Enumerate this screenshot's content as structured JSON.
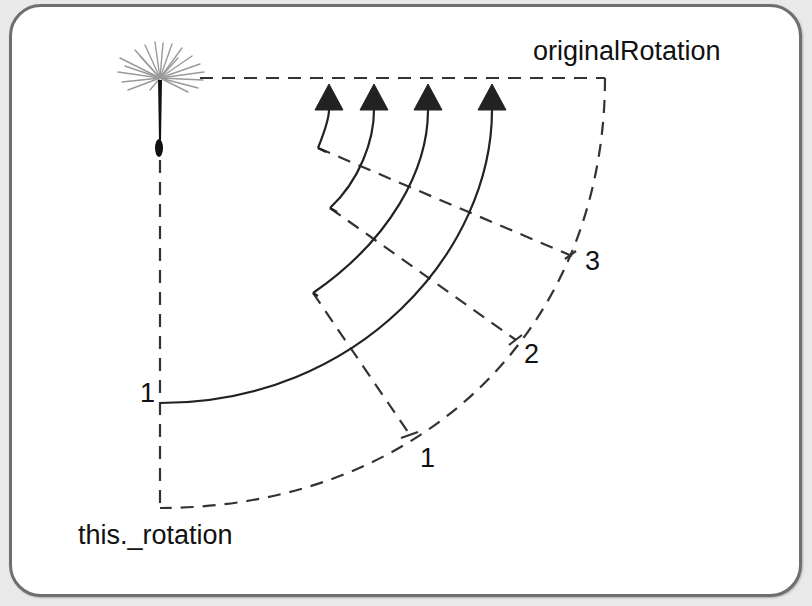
{
  "labels": {
    "original_rotation": "originalRotation",
    "this_rotation": "this._rotation",
    "step_1_outer": "1",
    "step_2_outer": "2",
    "step_3_outer": "3",
    "step_1_start": "1"
  },
  "colors": {
    "background": "#e9e9e9",
    "panel": "#ffffff",
    "panel_border": "#6f6f6f",
    "stroke": "#222222",
    "seed_fluff": "#9a9a9a",
    "arrowhead": "#222222"
  },
  "geometry": {
    "pivot": [
      160,
      78
    ],
    "outer_radius": 445,
    "arrow_tips_x": [
      329,
      374,
      428,
      492
    ],
    "radial_steps": [
      "1",
      "2",
      "3"
    ]
  }
}
